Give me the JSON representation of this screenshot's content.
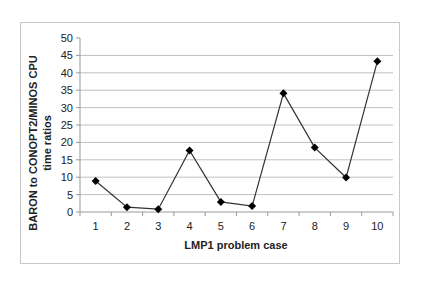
{
  "chart_data": {
    "type": "line",
    "title": "",
    "xlabel": "LMP1 problem case",
    "ylabel": "BARON to CONOPT2/MINOS CPU time ratios",
    "ylabel_lines": [
      "BARON to CONOPT2/MINOS CPU",
      "time ratios"
    ],
    "categories": [
      "1",
      "2",
      "3",
      "4",
      "5",
      "6",
      "7",
      "8",
      "9",
      "10"
    ],
    "values": [
      8.9,
      1.4,
      0.8,
      17.7,
      2.9,
      1.7,
      34.1,
      18.5,
      9.9,
      43.3
    ],
    "ylim": [
      0,
      50
    ],
    "yticks": [
      0,
      5,
      10,
      15,
      20,
      25,
      30,
      35,
      40,
      45,
      50
    ],
    "grid": true,
    "legend": null,
    "marker": "diamond",
    "colors": {
      "line": "#333333",
      "marker": "#000000",
      "grid": "#c0c0c0",
      "frame": "#c8c8c8"
    }
  }
}
